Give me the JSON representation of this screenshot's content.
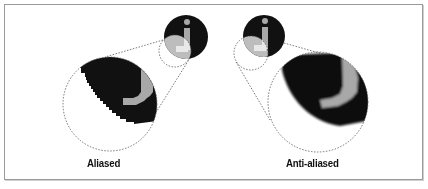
{
  "figure": {
    "glyph": "j",
    "colors": {
      "background": "#ffffff",
      "frame_border": "#9a9a9a",
      "disc": "#111111",
      "glyph_fill": "#a8a8a8",
      "dashed_line": "#555555",
      "label_text": "#111111"
    },
    "panels": [
      {
        "id": "aliased",
        "label": "Aliased"
      },
      {
        "id": "anti-aliased",
        "label": "Anti-aliased"
      }
    ]
  }
}
